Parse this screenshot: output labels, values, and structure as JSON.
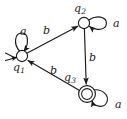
{
  "figure": {
    "kind": "finite-state-automaton",
    "colors": {
      "stroke": "#1a1a1a",
      "fill": "#ffffff",
      "background": "#ffffff"
    }
  },
  "states": [
    {
      "id": "q1",
      "name": "q",
      "subscript": "1",
      "x": 22,
      "y": 56,
      "radius": 5.6,
      "accepting": false,
      "start": true,
      "label_x": 13,
      "label_y": 62
    },
    {
      "id": "q2",
      "name": "q",
      "subscript": "2",
      "x": 84,
      "y": 23,
      "radius": 5.6,
      "accepting": false,
      "start": false,
      "label_x": 74,
      "label_y": 3
    },
    {
      "id": "q3",
      "name": "q",
      "subscript": "3",
      "x": 87,
      "y": 94,
      "radius": 8.4,
      "inner_radius": 5.4,
      "accepting": true,
      "start": false,
      "label_x": 64,
      "label_y": 72
    }
  ],
  "transitions": [
    {
      "id": "q1-q2",
      "from": "q1",
      "to": "q2",
      "symbol": "b",
      "label_x": 43,
      "label_y": 25
    },
    {
      "id": "q2-q3",
      "from": "q2",
      "to": "q3",
      "symbol": "b",
      "label_x": 89,
      "label_y": 52
    },
    {
      "id": "q3-q1",
      "from": "q3",
      "to": "q1",
      "symbol": "b",
      "label_x": 50,
      "label_y": 65
    },
    {
      "id": "q1-loop",
      "from": "q1",
      "to": "q1",
      "symbol": "a",
      "self_loop": true,
      "label_x": 20,
      "label_y": 26
    },
    {
      "id": "q2-loop",
      "from": "q2",
      "to": "q2",
      "symbol": "a",
      "self_loop": true,
      "label_x": 113,
      "label_y": 18
    },
    {
      "id": "q3-loop",
      "from": "q3",
      "to": "q3",
      "symbol": "a",
      "self_loop": true,
      "label_x": 115,
      "label_y": 99
    }
  ]
}
